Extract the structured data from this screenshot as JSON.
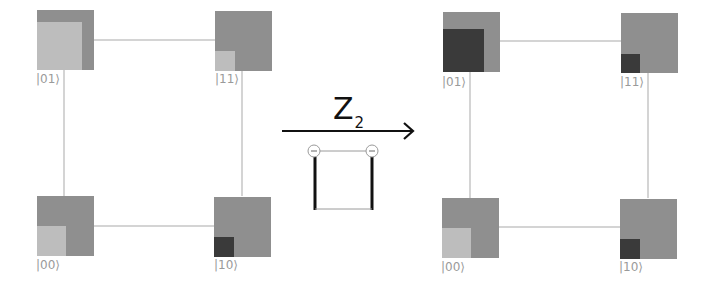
{
  "operator": {
    "symbol": "Z",
    "subscript": "2"
  },
  "colors": {
    "outer": "#8f8f8f",
    "light": "#bdbdbd",
    "dark": "#3a3a3a",
    "edge": "#d4d4d4",
    "arrow": "#111111",
    "label": "#9a9a9a"
  },
  "left_panel": {
    "nodes": [
      {
        "label": "|01⟩",
        "inner": "light",
        "inner_w": 45,
        "inner_h": 48
      },
      {
        "label": "|11⟩",
        "inner": "light",
        "inner_w": 20,
        "inner_h": 20
      },
      {
        "label": "|00⟩",
        "inner": "light",
        "inner_w": 29,
        "inner_h": 30
      },
      {
        "label": "|10⟩",
        "inner": "dark",
        "inner_w": 20,
        "inner_h": 20
      }
    ]
  },
  "right_panel": {
    "nodes": [
      {
        "label": "|01⟩",
        "inner": "dark",
        "inner_w": 42,
        "inner_h": 44
      },
      {
        "label": "|11⟩",
        "inner": "dark",
        "inner_w": 20,
        "inner_h": 20
      },
      {
        "label": "|00⟩",
        "inner": "light",
        "inner_w": 29,
        "inner_h": 30
      },
      {
        "label": "|10⟩",
        "inner": "dark",
        "inner_w": 20,
        "inner_h": 20
      }
    ]
  },
  "gate_diagram": {
    "left_circle": "minus",
    "right_circle": "minus"
  }
}
